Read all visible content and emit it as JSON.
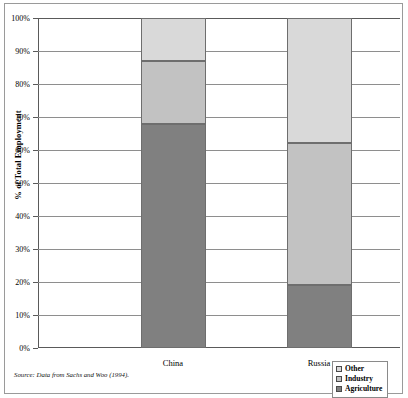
{
  "figure": {
    "source_note": "Source: Data from Sachs and Woo (1994)."
  },
  "legend": {
    "position": "bottom-right",
    "items": [
      {
        "label": "Other",
        "color": "#d9d9d9"
      },
      {
        "label": "Industry",
        "color": "#c2c2c2"
      },
      {
        "label": "Agriculture",
        "color": "#808080"
      }
    ]
  },
  "chart_data": {
    "type": "bar",
    "stacked": true,
    "stack_total": 100,
    "title": "",
    "subtitle": "",
    "xlabel": "",
    "ylabel": "% of Total Employment",
    "ylim": [
      0,
      100
    ],
    "yticks": [
      0,
      10,
      20,
      30,
      40,
      50,
      60,
      70,
      80,
      90,
      100
    ],
    "ytick_labels": [
      "0%",
      "10%",
      "20%",
      "30%",
      "40%",
      "50%",
      "60%",
      "70%",
      "80%",
      "90%",
      "100%"
    ],
    "grid": true,
    "grid_axis": "y",
    "legend_position": "bottom-right",
    "categories": [
      "China",
      "Russia"
    ],
    "series": [
      {
        "name": "Agriculture",
        "color": "#808080",
        "values": [
          68,
          19
        ]
      },
      {
        "name": "Industry",
        "color": "#c2c2c2",
        "values": [
          19,
          43
        ]
      },
      {
        "name": "Other",
        "color": "#d9d9d9",
        "values": [
          13,
          38
        ]
      }
    ],
    "cumulative_tops": {
      "China": {
        "Agriculture": 68,
        "Industry": 87,
        "Other": 100
      },
      "Russia": {
        "Agriculture": 19,
        "Industry": 62,
        "Other": 100
      }
    },
    "annotations": []
  }
}
